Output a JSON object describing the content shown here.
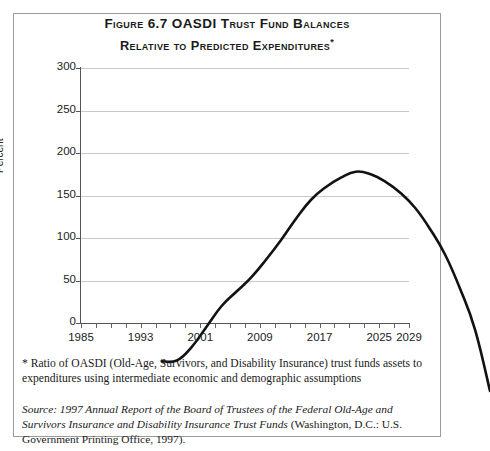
{
  "figure": {
    "title_line_1": "Figure 6.7  OASDI Trust Fund Balances",
    "title_line_2": "Relative to Predicted Expenditures",
    "title_footnote_marker": "*"
  },
  "footnote": "* Ratio of OASDI (Old-Age, Survivors, and Disability Insurance) trust funds assets to expenditures using intermediate economic and demographic assumptions",
  "source_note": {
    "label": "Source:",
    "italic_text": " 1997 Annual Report of the Board of Trustees of the Federal Old-Age and Survivors Insurance and Disability Insurance Trust Funds",
    "roman_text": " (Washington, D.C.: U.S. Government Printing Office, 1997)."
  },
  "chart_data": {
    "type": "line",
    "title": "Figure 6.7 OASDI Trust Fund Balances Relative to Predicted Expenditures",
    "xlabel": "",
    "ylabel": "Percent",
    "xlim": [
      1985,
      2029
    ],
    "ylim": [
      0,
      300
    ],
    "ytick_values": [
      0,
      50,
      100,
      150,
      200,
      250,
      300
    ],
    "ytick_labels": [
      "0",
      "50",
      "100",
      "150",
      "200",
      "250",
      "300"
    ],
    "xtick_values": [
      1985,
      1987,
      1989,
      1991,
      1993,
      1995,
      1997,
      1999,
      2001,
      2003,
      2005,
      2007,
      2009,
      2011,
      2013,
      2015,
      2017,
      2019,
      2021,
      2023,
      2025,
      2027,
      2029
    ],
    "xtick_labels_shown": [
      "1985",
      "1993",
      "2001",
      "2009",
      "2017",
      "2025",
      "2029"
    ],
    "xtick_labels_shown_values": [
      1985,
      1993,
      2001,
      2009,
      2017,
      2025,
      2029
    ],
    "grid": "horizontal",
    "legend": "none",
    "line_color": "#121212",
    "line_width_px": 2.6,
    "series": [
      {
        "name": "OASDI trust fund balance as percent of annual expenditures",
        "x": [
          1985,
          1987,
          1989,
          1991,
          1993,
          1995,
          1997,
          1999,
          2001,
          2003,
          2005,
          2007,
          2009,
          2011,
          2013,
          2015,
          2017,
          2019,
          2021,
          2023,
          2025,
          2027,
          2029
        ],
        "values": [
          35,
          36,
          52,
          76,
          100,
          117,
          134,
          155,
          178,
          203,
          225,
          240,
          251,
          258,
          255,
          246,
          233,
          215,
          190,
          160,
          120,
          72,
          0
        ]
      }
    ],
    "annotations": [
      {
        "text": "peak of about 258 percent around 2011",
        "x": 2011,
        "y": 258
      },
      {
        "text": "fund exhausted (0 percent) in 2029",
        "x": 2029,
        "y": 0
      }
    ]
  }
}
